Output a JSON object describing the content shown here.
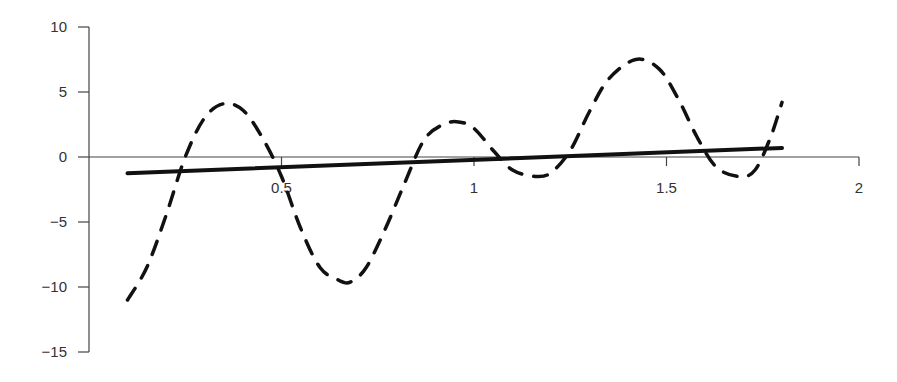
{
  "chart_data": {
    "type": "line",
    "title": "",
    "xlabel": "",
    "ylabel": "",
    "xlim": [
      0,
      2
    ],
    "ylim": [
      -15,
      10
    ],
    "x_ticks": [
      0.5,
      1,
      1.5,
      2
    ],
    "x_tick_labels": [
      "0.5",
      "1",
      "1.5",
      "2"
    ],
    "y_ticks": [
      10,
      5,
      0,
      -5,
      -10,
      -15
    ],
    "y_tick_labels": [
      "10",
      "5",
      "0",
      "−5",
      "−10",
      "−15"
    ],
    "grid": false,
    "legend": null,
    "series": [
      {
        "name": "dashed-curve",
        "style": "dashed",
        "color": "#111111",
        "x": [
          0.1,
          0.15,
          0.2,
          0.25,
          0.3,
          0.35,
          0.4,
          0.45,
          0.5,
          0.55,
          0.6,
          0.65,
          0.68,
          0.72,
          0.77,
          0.82,
          0.87,
          0.92,
          0.96,
          1.0,
          1.05,
          1.1,
          1.16,
          1.2,
          1.25,
          1.3,
          1.35,
          1.42,
          1.48,
          1.53,
          1.58,
          1.63,
          1.69,
          1.73,
          1.77,
          1.8
        ],
        "values": [
          -11.0,
          -8.5,
          -4.5,
          0.0,
          3.0,
          4.1,
          3.6,
          1.5,
          -1.5,
          -5.5,
          -8.5,
          -9.5,
          -9.6,
          -8.5,
          -5.5,
          -2.0,
          1.3,
          2.5,
          2.7,
          2.2,
          0.5,
          -1.0,
          -1.5,
          -1.2,
          0.5,
          3.5,
          6.0,
          7.5,
          6.8,
          4.5,
          1.5,
          -0.8,
          -1.5,
          -1.0,
          1.5,
          4.2
        ]
      },
      {
        "name": "solid-line",
        "style": "solid",
        "color": "#111111",
        "x": [
          0.1,
          1.8
        ],
        "values": [
          -1.25,
          0.7
        ]
      }
    ]
  }
}
